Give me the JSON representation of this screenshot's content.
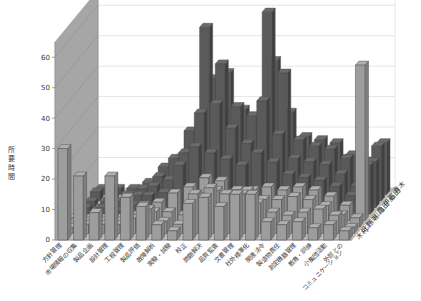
{
  "chart_data": {
    "type": "bar",
    "subtype": "3d-clustered-column",
    "title": "",
    "xlabel": "",
    "ylabel": "所要時間",
    "zlabel": "",
    "ylim": [
      0,
      65
    ],
    "yticks": [
      0,
      10,
      20,
      30,
      40,
      50,
      60
    ],
    "grid": true,
    "legend_position": "depth-axis-right",
    "colors": {
      "bar_front_dark": "#5a5a5a",
      "bar_front_light": "#9d9d9d",
      "bar_top": "#707070",
      "bar_side": "#b4b4b4",
      "wall_back": "#ffffff",
      "wall_left": "#a6a6a6",
      "floor": "#bdbdbd",
      "gridline": "#d9d9d9",
      "text": "#3a3a3a"
    },
    "categories": [
      "方針管理",
      "市場情報の収集",
      "製品企画",
      "設計管理",
      "工程管理",
      "製品評価",
      "故障解析",
      "実験・試験",
      "校正",
      "問題解決",
      "品質監査",
      "文書管理",
      "社外標準化",
      "関連法令",
      "製造物責任",
      "測定機器管理",
      "教育・訓練",
      "小集団活動",
      "外部との\nコミュニケーション"
    ],
    "series": [
      {
        "name": "木村",
        "values": [
          30,
          21,
          9,
          21,
          14,
          11,
          5,
          3,
          12,
          14,
          11,
          15,
          15,
          6,
          5,
          6,
          4,
          5,
          3
        ]
      },
      {
        "name": "北野",
        "values": [
          2,
          3,
          3,
          3,
          5,
          8,
          4,
          3,
          13,
          15,
          13,
          13,
          10,
          7,
          6,
          7,
          8,
          6,
          2
        ]
      },
      {
        "name": "川端",
        "values": [
          3,
          2,
          2,
          2,
          4,
          5,
          5,
          4,
          10,
          12,
          11,
          12,
          9,
          9,
          10,
          9,
          7,
          4,
          3
        ]
      },
      {
        "name": "川口",
        "values": [
          2,
          2,
          2,
          3,
          5,
          6,
          9,
          11,
          14,
          13,
          10,
          10,
          11,
          10,
          11,
          10,
          8,
          5,
          51
        ]
      },
      {
        "name": "亀田",
        "values": [
          2,
          2,
          1,
          3,
          6,
          7,
          16,
          22,
          20,
          18,
          16,
          20,
          17,
          13,
          12,
          11,
          9,
          6,
          16
        ]
      },
      {
        "name": "伊藤",
        "values": [
          2,
          2,
          2,
          4,
          7,
          9,
          18,
          31,
          34,
          26,
          21,
          35,
          24,
          16,
          15,
          14,
          11,
          7,
          15
        ]
      },
      {
        "name": "石田",
        "values": [
          3,
          3,
          2,
          4,
          8,
          14,
          23,
          57,
          45,
          31,
          28,
          62,
          42,
          20,
          18,
          17,
          14,
          9,
          18
        ]
      },
      {
        "name": "青木",
        "values": [
          2,
          2,
          2,
          4,
          9,
          12,
          20,
          38,
          40,
          28,
          24,
          44,
          27,
          19,
          18,
          17,
          13,
          11,
          17
        ]
      }
    ]
  },
  "axis": {
    "y_title": "所要時間",
    "y_tick_labels": [
      "0",
      "10",
      "20",
      "30",
      "40",
      "50",
      "60"
    ]
  }
}
